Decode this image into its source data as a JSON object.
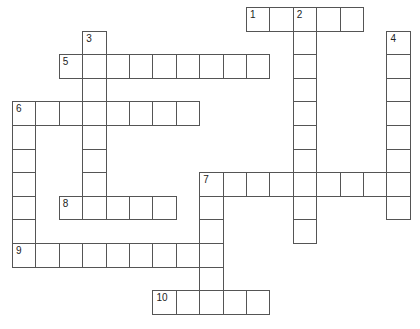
{
  "puzzle": {
    "type": "crossword",
    "grid": {
      "origin_x": 12,
      "origin_y": 7,
      "cell_w": 23.4,
      "cell_h": 23.6,
      "line_color": "#555555",
      "background": "#ffffff"
    },
    "words": [
      {
        "number": "1",
        "direction": "across",
        "row": 0,
        "col": 10,
        "length": 5
      },
      {
        "number": "2",
        "direction": "down",
        "row": 0,
        "col": 12,
        "length": 10
      },
      {
        "number": "3",
        "direction": "down",
        "row": 1,
        "col": 3,
        "length": 8
      },
      {
        "number": "4",
        "direction": "down",
        "row": 1,
        "col": 16,
        "length": 8
      },
      {
        "number": "5",
        "direction": "across",
        "row": 2,
        "col": 2,
        "length": 9
      },
      {
        "number": "6",
        "direction": "across",
        "row": 4,
        "col": 0,
        "length": 8
      },
      {
        "number": "6",
        "direction": "down",
        "row": 4,
        "col": 0,
        "length": 7
      },
      {
        "number": "7",
        "direction": "across",
        "row": 7,
        "col": 8,
        "length": 9
      },
      {
        "number": "7",
        "direction": "down",
        "row": 7,
        "col": 8,
        "length": 6
      },
      {
        "number": "8",
        "direction": "across",
        "row": 8,
        "col": 2,
        "length": 5
      },
      {
        "number": "9",
        "direction": "across",
        "row": 10,
        "col": 0,
        "length": 9
      },
      {
        "number": "10",
        "direction": "across",
        "row": 12,
        "col": 6,
        "length": 5
      }
    ],
    "clue_numbers": [
      {
        "label": "1",
        "row": 0,
        "col": 10
      },
      {
        "label": "2",
        "row": 0,
        "col": 12
      },
      {
        "label": "3",
        "row": 1,
        "col": 3
      },
      {
        "label": "4",
        "row": 1,
        "col": 16
      },
      {
        "label": "5",
        "row": 2,
        "col": 2
      },
      {
        "label": "6",
        "row": 4,
        "col": 0
      },
      {
        "label": "7",
        "row": 7,
        "col": 8
      },
      {
        "label": "8",
        "row": 8,
        "col": 2
      },
      {
        "label": "9",
        "row": 10,
        "col": 0
      },
      {
        "label": "10",
        "row": 12,
        "col": 6
      }
    ]
  }
}
